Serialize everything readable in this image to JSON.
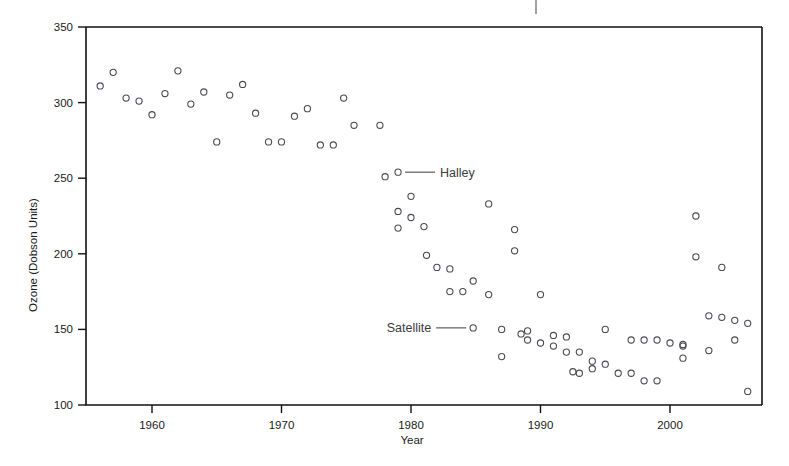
{
  "chart_data": {
    "type": "scatter",
    "title": "",
    "xlabel": "Year",
    "ylabel": "Ozone (Dobson Units)",
    "xlim": [
      1955,
      2007
    ],
    "ylim": [
      100,
      350
    ],
    "grid": false,
    "legend_position": "inline-annotation",
    "x_ticks": [
      1960,
      1970,
      1980,
      1990,
      2000
    ],
    "x_tick_labels": [
      "1960",
      "1970",
      "1980",
      "1990",
      "2000"
    ],
    "y_ticks": [
      100,
      150,
      200,
      250,
      300,
      350
    ],
    "y_tick_labels": [
      "100",
      "150",
      "200",
      "250",
      "300",
      "350"
    ],
    "annotations": [
      {
        "text": "Halley",
        "x": 1979.0,
        "y": 254,
        "marker_x": 1954.0
      },
      {
        "text": "Satellite",
        "x": 1984.8,
        "y": 151,
        "marker_x": 1954.0
      }
    ],
    "series": [
      {
        "name": "Halley",
        "marker": "open-circle",
        "color": "#4a4a55",
        "points": [
          {
            "x": 1956,
            "y": 311
          },
          {
            "x": 1957,
            "y": 320
          },
          {
            "x": 1958,
            "y": 303
          },
          {
            "x": 1959,
            "y": 301
          },
          {
            "x": 1960,
            "y": 292
          },
          {
            "x": 1961,
            "y": 306
          },
          {
            "x": 1962,
            "y": 321
          },
          {
            "x": 1963,
            "y": 299
          },
          {
            "x": 1964,
            "y": 307
          },
          {
            "x": 1965,
            "y": 274
          },
          {
            "x": 1966,
            "y": 305
          },
          {
            "x": 1967,
            "y": 312
          },
          {
            "x": 1968,
            "y": 293
          },
          {
            "x": 1969,
            "y": 274
          },
          {
            "x": 1970,
            "y": 274
          },
          {
            "x": 1971,
            "y": 291
          },
          {
            "x": 1972,
            "y": 296
          },
          {
            "x": 1973,
            "y": 272
          },
          {
            "x": 1974,
            "y": 272
          },
          {
            "x": 1974.8,
            "y": 303
          },
          {
            "x": 1975.6,
            "y": 285
          },
          {
            "x": 1977.6,
            "y": 285
          },
          {
            "x": 1978,
            "y": 251
          },
          {
            "x": 1979,
            "y": 228
          },
          {
            "x": 1979,
            "y": 217
          },
          {
            "x": 1980,
            "y": 238
          },
          {
            "x": 1980,
            "y": 224
          },
          {
            "x": 1981,
            "y": 218
          },
          {
            "x": 1981.2,
            "y": 199
          },
          {
            "x": 1982,
            "y": 191
          },
          {
            "x": 1983,
            "y": 190
          },
          {
            "x": 1983,
            "y": 175
          },
          {
            "x": 1984,
            "y": 175
          },
          {
            "x": 1984.8,
            "y": 182
          },
          {
            "x": 1986,
            "y": 233
          },
          {
            "x": 1986,
            "y": 173
          },
          {
            "x": 1988,
            "y": 216
          },
          {
            "x": 1988,
            "y": 202
          },
          {
            "x": 1990,
            "y": 173
          },
          {
            "x": 1988.5,
            "y": 147
          },
          {
            "x": 2002,
            "y": 225
          },
          {
            "x": 2002,
            "y": 198
          },
          {
            "x": 2004,
            "y": 191
          }
        ]
      },
      {
        "name": "Satellite",
        "marker": "open-circle",
        "color": "#4a4a55",
        "points": [
          {
            "x": 1987,
            "y": 150
          },
          {
            "x": 1987,
            "y": 132
          },
          {
            "x": 1989,
            "y": 149
          },
          {
            "x": 1989,
            "y": 143
          },
          {
            "x": 1990,
            "y": 141
          },
          {
            "x": 1991,
            "y": 146
          },
          {
            "x": 1991,
            "y": 139
          },
          {
            "x": 1992,
            "y": 145
          },
          {
            "x": 1992,
            "y": 135
          },
          {
            "x": 1992.5,
            "y": 122
          },
          {
            "x": 1993,
            "y": 135
          },
          {
            "x": 1993,
            "y": 121
          },
          {
            "x": 1994,
            "y": 129
          },
          {
            "x": 1994,
            "y": 124
          },
          {
            "x": 1995,
            "y": 150
          },
          {
            "x": 1995,
            "y": 127
          },
          {
            "x": 1996,
            "y": 121
          },
          {
            "x": 1997,
            "y": 143
          },
          {
            "x": 1997,
            "y": 121
          },
          {
            "x": 1998,
            "y": 143
          },
          {
            "x": 1998,
            "y": 116
          },
          {
            "x": 1999,
            "y": 143
          },
          {
            "x": 1999,
            "y": 116
          },
          {
            "x": 2000,
            "y": 141
          },
          {
            "x": 2001,
            "y": 140
          },
          {
            "x": 2001,
            "y": 139
          },
          {
            "x": 2001,
            "y": 131
          },
          {
            "x": 2003,
            "y": 159
          },
          {
            "x": 2003,
            "y": 136
          },
          {
            "x": 2004,
            "y": 158
          },
          {
            "x": 2005,
            "y": 156
          },
          {
            "x": 2005,
            "y": 143
          },
          {
            "x": 2006,
            "y": 154
          },
          {
            "x": 2006,
            "y": 109
          }
        ]
      }
    ]
  },
  "axes": {
    "y_title": "Ozone (Dobson Units)",
    "x_title": "Year"
  }
}
